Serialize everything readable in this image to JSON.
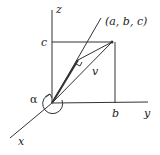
{
  "diagram": {
    "axes": {
      "x": "x",
      "y": "y",
      "z": "z"
    },
    "point_label": "(a, b, c)",
    "vector_label": "v",
    "tick_b": "b",
    "tick_c": "c",
    "angle_label": "α",
    "colors": {
      "line": "#333333",
      "background": "#ffffff"
    }
  }
}
